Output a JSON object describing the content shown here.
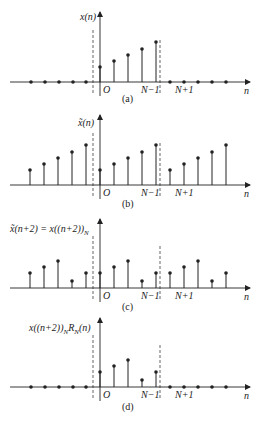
{
  "figure": {
    "panels": [
      {
        "id": "a",
        "caption": "(a)",
        "ylabel": "x(n)",
        "axis_y": 82,
        "top_y": 12,
        "stems_x": [
          100,
          114,
          128,
          142,
          156
        ],
        "stems_h": [
          15,
          21,
          27,
          33,
          40
        ],
        "zero_dots_x": [
          31,
          45,
          59,
          73,
          86,
          170,
          184,
          198,
          212,
          226
        ],
        "dash_left_x": 93,
        "dash_right_x": 160,
        "cap_y": 101
      },
      {
        "id": "b",
        "caption": "(b)",
        "ylabel": "x̃(n)",
        "axis_y": 185,
        "top_y": 115,
        "stems_x": [
          30,
          44,
          58,
          72,
          86,
          100,
          114,
          128,
          142,
          156,
          170,
          184,
          198,
          212,
          226
        ],
        "stems_h": [
          15,
          21,
          27,
          33,
          40,
          15,
          21,
          27,
          33,
          40,
          15,
          21,
          27,
          33,
          40
        ],
        "zero_dots_x": [],
        "dash_left_x": 93,
        "dash_right_x": 160,
        "cap_y": 206
      },
      {
        "id": "c",
        "caption": "(c)",
        "ylabel": "x̃(n+2) = x((n+2))",
        "ylabel_sub": "N",
        "axis_y": 288,
        "top_y": 219,
        "stems_x": [
          30,
          44,
          58,
          72,
          86,
          100,
          114,
          128,
          142,
          156,
          170,
          184,
          198,
          212,
          226
        ],
        "stems_h": [
          15,
          21,
          27,
          7,
          15,
          15,
          21,
          27,
          7,
          15,
          15,
          21,
          27,
          7,
          15
        ],
        "zero_dots_x": [],
        "dash_left_x": 93,
        "dash_right_x": 160,
        "cap_y": 309
      },
      {
        "id": "d",
        "caption": "(d)",
        "ylabel": "x((n+2))",
        "ylabel_sub": "N",
        "ylabel_tail": "R",
        "ylabel_tail_sub": "N",
        "ylabel_end": "(n)",
        "axis_y": 387,
        "top_y": 318,
        "stems_x": [
          100,
          114,
          128,
          142,
          156
        ],
        "stems_h": [
          15,
          21,
          27,
          7,
          15
        ],
        "zero_dots_x": [
          31,
          45,
          59,
          73,
          86,
          170,
          184,
          198,
          212,
          226
        ],
        "dash_left_x": 93,
        "dash_right_x": 160,
        "cap_y": 409
      }
    ],
    "tick_labels": {
      "origin": "O",
      "n_minus_1": "N−1",
      "n_plus_1": "N+1",
      "axis_var": "n"
    },
    "colors": {
      "ink": "#222222",
      "background": "#ffffff"
    }
  }
}
